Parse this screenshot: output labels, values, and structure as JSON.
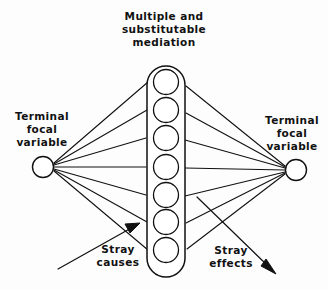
{
  "diagram": {
    "title": "Multiple and\nsubstitutable\nmediation",
    "left_node_label": "Terminal\nfocal\nvariable",
    "right_node_label": "Terminal\nfocal\nvariable",
    "stray_causes_label": "Stray\ncauses",
    "stray_effects_label": "Stray\neffects",
    "stroke_color": "#111111",
    "fill_color": "#ffffff",
    "background_color": "#fdfdfd",
    "mediator_count": 7,
    "left_fan_line_count": 7,
    "right_fan_line_count": 7
  }
}
